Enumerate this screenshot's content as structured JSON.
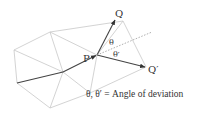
{
  "diagram": {
    "type": "mesh-path-deviation",
    "colors": {
      "mesh": "#c8c8c8",
      "path": "#444444",
      "dotted": "#999999",
      "text": "#333333"
    },
    "mesh_vertices": {
      "A": [
        14,
        50
      ],
      "B": [
        50,
        32
      ],
      "C": [
        123,
        21
      ],
      "D": [
        146,
        67
      ],
      "E": [
        90,
        93
      ],
      "F": [
        50,
        108
      ],
      "G": [
        17,
        83
      ],
      "M": [
        63,
        72
      ],
      "P": [
        97,
        55
      ]
    },
    "labels": {
      "P": "P",
      "Q": "Q",
      "Q_prime": "Q′",
      "theta": "θ",
      "theta_prime": "θ′"
    },
    "caption": "θ, θ′ = Angle of deviation"
  }
}
